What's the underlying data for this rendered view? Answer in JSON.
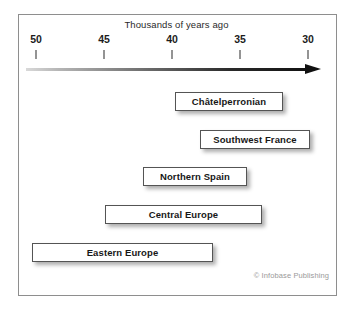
{
  "figure": {
    "axis_title": "Thousands of years ago",
    "credit": "© Infobase Publishing"
  },
  "chart_data": {
    "type": "bar",
    "title": "Thousands of years ago",
    "subtitle": "",
    "xlabel": "Thousands of years ago",
    "ylabel": "",
    "orientation": "horizontal",
    "axis_direction": "decreasing",
    "xlim": [
      50,
      30
    ],
    "xticks": [
      50,
      45,
      40,
      35,
      30
    ],
    "xtick_labels": [
      "50",
      "45",
      "40",
      "35",
      "30"
    ],
    "grid": false,
    "legend": null,
    "annotations": [
      "© Infobase Publishing"
    ],
    "categories": [
      "Châtelperronian",
      "Southwest France",
      "Northern Spain",
      "Central Europe",
      "Eastern Europe"
    ],
    "bars": [
      {
        "label": "Châtelperronian",
        "start_kya": 39.8,
        "end_kya": 31.8
      },
      {
        "label": "Southwest France",
        "start_kya": 37.9,
        "end_kya": 29.9
      },
      {
        "label": "Northern Spain",
        "start_kya": 42.2,
        "end_kya": 34.5
      },
      {
        "label": "Central Europe",
        "start_kya": 45.0,
        "end_kya": 33.4
      },
      {
        "label": "Eastern Europe",
        "start_kya": 50.3,
        "end_kya": 37.0
      }
    ]
  },
  "layout": {
    "ticks_px": [
      36,
      104,
      172,
      240,
      308
    ],
    "bars_px": [
      {
        "left": 175,
        "width": 108,
        "top": 92
      },
      {
        "left": 200,
        "width": 110,
        "top": 130
      },
      {
        "left": 143,
        "width": 104,
        "top": 167
      },
      {
        "left": 105,
        "width": 157,
        "top": 205
      },
      {
        "left": 32,
        "width": 181,
        "top": 243
      }
    ]
  }
}
